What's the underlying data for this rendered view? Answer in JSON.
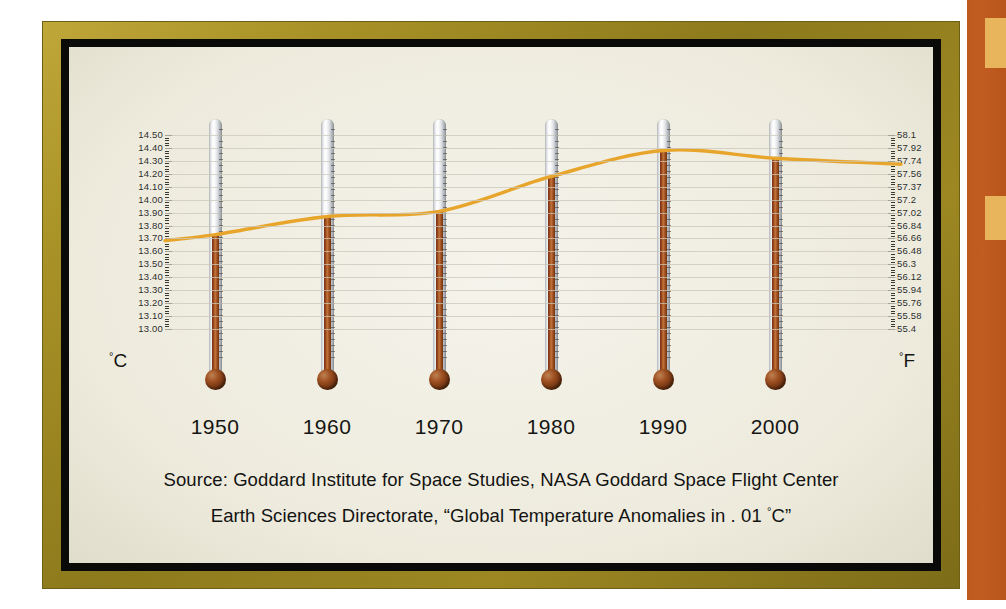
{
  "chart_data": {
    "type": "line",
    "title": "",
    "subtitle": "",
    "xlabel": "",
    "ylabel": "",
    "left_axis": {
      "unit_label": "C",
      "unit_degree": "°",
      "ticks": [
        "14.50",
        "14.40",
        "14.30",
        "14.20",
        "14.10",
        "14.00",
        "13.90",
        "13.80",
        "13.70",
        "13.60",
        "13.50",
        "13.40",
        "13.30",
        "13.20",
        "13.10",
        "13.00"
      ],
      "min": 13.0,
      "max": 14.5
    },
    "right_axis": {
      "unit_label": "F",
      "unit_degree": "°",
      "ticks": [
        "58.1",
        "57.92",
        "57.74",
        "57.56",
        "57.37",
        "57.2",
        "57.02",
        "56.84",
        "56.66",
        "56.48",
        "56.3",
        "56.12",
        "55.94",
        "55.76",
        "55.58",
        "55.4"
      ],
      "min": 55.4,
      "max": 58.1
    },
    "categories": [
      "1950",
      "1960",
      "1970",
      "1980",
      "1990",
      "2000"
    ],
    "values": [
      13.73,
      13.87,
      13.91,
      14.18,
      14.38,
      14.32
    ],
    "series": [
      {
        "name": "Global mean surface temperature",
        "values": [
          13.73,
          13.87,
          13.91,
          14.18,
          14.38,
          14.32
        ]
      }
    ],
    "grid": true,
    "legend": "none",
    "line_color": "#e8a52c",
    "marker": "thermometer",
    "annotations": []
  },
  "frame": {
    "gold_color": "#9c8722",
    "inner_border_color": "#0a0a08",
    "paper_color": "#f1efe2"
  },
  "decor": {
    "rust_color": "#bf5a1e",
    "tab_color": "#e8b45c"
  },
  "source": {
    "line1": "Source: Goddard Institute for Space Studies, NASA Goddard Space Flight Center",
    "line2_a": "Earth Sciences Directorate, “Global Temperature Anomalies in . 01 ",
    "line2_deg": "°",
    "line2_b": "C”"
  }
}
